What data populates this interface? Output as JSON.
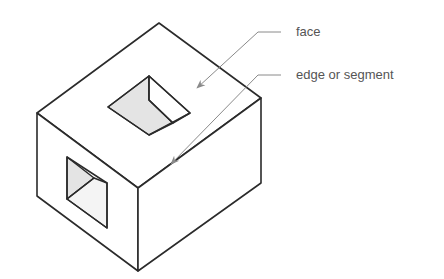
{
  "diagram": {
    "title": "",
    "labels": [
      {
        "id": "face",
        "text": "face",
        "points_to": "top recessed face of opening"
      },
      {
        "id": "edge",
        "text": "edge or segment",
        "points_to": "front edge of block"
      }
    ],
    "colors": {
      "outline": "#2b2b2b",
      "leader": "#8a8a8a",
      "shaded_face": "#e4e4e4",
      "light_face": "#f4f4f4",
      "label_text": "#555555"
    }
  }
}
